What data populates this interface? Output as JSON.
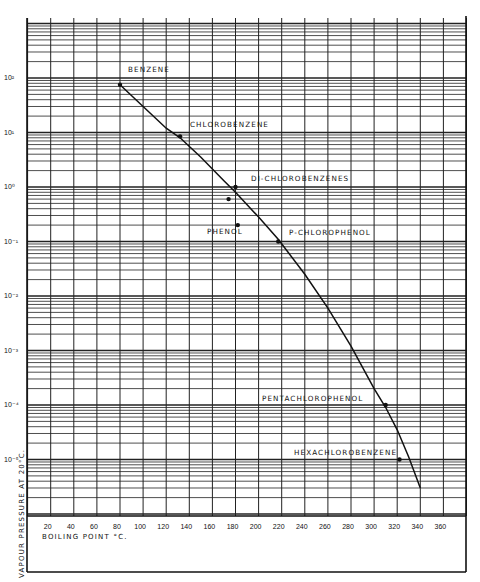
{
  "chart_data": {
    "type": "line",
    "title": "",
    "xlabel": "BOILING POINT °C.",
    "ylabel": "VAPOUR PRESSURE AT 20°C.",
    "xlim": [
      0,
      380
    ],
    "ylim": [
      1e-06,
      1000
    ],
    "yscale": "log",
    "grid": true,
    "x_ticks": [
      "20",
      "40",
      "60",
      "80",
      "100",
      "120",
      "140",
      "160",
      "180",
      "200",
      "220",
      "240",
      "260",
      "280",
      "300",
      "320",
      "340",
      "360"
    ],
    "y_ticks": [
      "10²",
      "10¹",
      "10⁰",
      "10⁻¹",
      "10⁻²",
      "10⁻³",
      "10⁻⁴",
      "10⁻⁵"
    ],
    "points": [
      {
        "label": "BENZENE",
        "x": 80,
        "y": 75
      },
      {
        "label": "CHLOROBENZENE",
        "x": 132,
        "y": 8.5
      },
      {
        "label": "DI-CHLOROBENZENES",
        "x": 180,
        "y": 1.0
      },
      {
        "label": "DI-CHLOROBENZENES",
        "x": 174,
        "y": 0.6
      },
      {
        "label": "PHENOL",
        "x": 182,
        "y": 0.2
      },
      {
        "label": "P-CHLOROPHENOL",
        "x": 217,
        "y": 0.1
      },
      {
        "label": "PENTACHLOROPHENOL",
        "x": 310,
        "y": 0.0001
      },
      {
        "label": "HEXACHLOROBENZENE",
        "x": 322,
        "y": 1e-05
      }
    ],
    "series": [
      {
        "name": "vapour pressure curve",
        "x": [
          80,
          100,
          120,
          132,
          150,
          170,
          180,
          200,
          217,
          240,
          260,
          280,
          300,
          310,
          320,
          330,
          340
        ],
        "y": [
          75,
          30,
          12,
          8.0,
          3.5,
          1.3,
          0.8,
          0.28,
          0.11,
          0.025,
          0.006,
          0.0012,
          0.0002,
          9e-05,
          3.5e-05,
          1.1e-05,
          3e-06
        ]
      }
    ],
    "annotations": [
      "BENZENE",
      "CHLOROBENZENE",
      "DI-CHLOROBENZENES",
      "PHENOL",
      "P-CHLOROPHENOL",
      "PENTACHLOROPHENOL",
      "HEXACHLOROBENZENE"
    ]
  },
  "labels": {
    "benzene": "BENZENE",
    "chlorobenzene": "CHLOROBENZENE",
    "dichlorobenzenes": "DI-CHLOROBENZENES",
    "phenol": "PHENOL",
    "pchlorophenol": "P-CHLOROPHENOL",
    "pentachlorophenol": "PENTACHLOROPHENOL",
    "hexachlorobenzene": "HEXACHLOROBENZENE",
    "xlabel": "BOILING POINT °C.",
    "ylabel": "VAPOUR PRESSURE AT 20°C."
  },
  "style": {
    "ink": "#111111",
    "paper": "#ffffff",
    "grid": "#333333"
  }
}
